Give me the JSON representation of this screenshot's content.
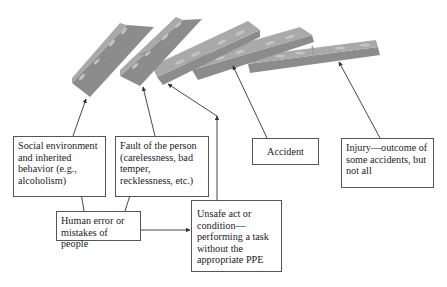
{
  "diagram": {
    "type": "domino-theory-accident-causation",
    "dominoes": [
      {
        "id": "d1",
        "label": "Social environment domino"
      },
      {
        "id": "d2",
        "label": "Fault of the person domino"
      },
      {
        "id": "d3",
        "label": "Unsafe act domino"
      },
      {
        "id": "d4",
        "label": "Accident domino"
      },
      {
        "id": "d5",
        "label": "Injury domino"
      }
    ],
    "boxes": {
      "social": "Social environment and inherited behavior (e.g., alcoholism)",
      "fault": "Fault of the person (carelessness, bad temper, recklessness, etc.)",
      "accident": "Accident",
      "injury": "Injury—outcome of some accidents, but not all",
      "human_error": "Human error or mistakes of people",
      "unsafe": "Unsafe act or condition—performing a task without the appropriate PPE"
    },
    "colors": {
      "domino_face": "#8a8a8a",
      "domino_top": "#a8a8a8",
      "domino_dot": "#c8c8c8",
      "line": "#333333",
      "box_border": "#555555"
    }
  }
}
